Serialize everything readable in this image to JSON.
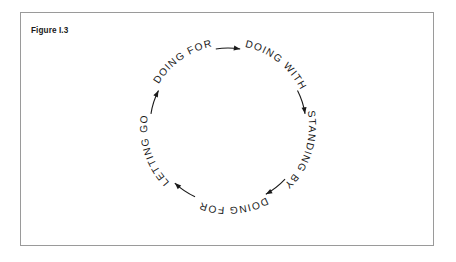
{
  "figure": {
    "caption": "Figure I.3",
    "border_color": "#9a9a9a",
    "background_color": "#ffffff",
    "ink_color": "#1a1a1a"
  },
  "diagram": {
    "type": "cycle",
    "direction": "clockwise",
    "center_x": 228,
    "center_y": 126,
    "radius": 78,
    "labels": [
      {
        "id": "doing-for-top",
        "text": "DOING FOR",
        "position": "upper-left",
        "angle_deg": -125
      },
      {
        "id": "doing-with",
        "text": "DOING WITH",
        "position": "upper-right",
        "angle_deg": -52
      },
      {
        "id": "standing-by",
        "text": "STANDING BY",
        "position": "right",
        "angle_deg": 18
      },
      {
        "id": "doing-for-bottom",
        "text": "DOING FOR",
        "position": "bottom",
        "angle_deg": 86
      },
      {
        "id": "letting-go",
        "text": "LETTING GO",
        "position": "left",
        "angle_deg": 162
      }
    ],
    "arrows": [
      {
        "id": "arrow-top",
        "from": "doing-for-top",
        "to": "doing-with",
        "angle_deg": -90
      },
      {
        "id": "arrow-right-upper",
        "from": "doing-with",
        "to": "standing-by",
        "angle_deg": -18
      },
      {
        "id": "arrow-right-lower",
        "from": "standing-by",
        "to": "doing-for-bottom",
        "angle_deg": 52
      },
      {
        "id": "arrow-bottom-left",
        "from": "doing-for-bottom",
        "to": "letting-go",
        "angle_deg": 124
      },
      {
        "id": "arrow-left-upper",
        "from": "letting-go",
        "to": "doing-for-top",
        "angle_deg": -162
      }
    ]
  }
}
